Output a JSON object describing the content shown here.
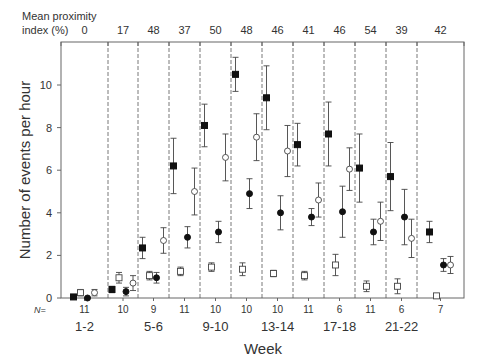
{
  "chart_data": {
    "type": "scatter",
    "title": "",
    "top_label": "Mean proximity index (%)",
    "top_label_lines": [
      "Mean proximity",
      "index (%)"
    ],
    "top_values": [
      "0",
      "17",
      "48",
      "37",
      "50",
      "48",
      "46",
      "41",
      "46",
      "54",
      "39",
      "42"
    ],
    "xlabel": "Week",
    "ylabel": "Number of events per hour",
    "ylim": [
      0,
      11.7
    ],
    "yticks": [
      0,
      2,
      4,
      6,
      8,
      10
    ],
    "n_label": "N=",
    "n_values": [
      "11",
      "10",
      "9",
      "11",
      "10",
      "10",
      "10",
      "11",
      "6",
      "11",
      "6",
      "7"
    ],
    "week_labels": [
      "1-2",
      "5-6",
      "9-10",
      "13-14",
      "17-18",
      "21-22"
    ],
    "groups": [
      "1-2",
      "3-4",
      "5-6",
      "7-8",
      "9-10",
      "11-12",
      "13-14",
      "15-16",
      "17-18",
      "19-20",
      "21-22",
      "23-24"
    ],
    "grid": false,
    "series": [
      {
        "name": "filled-square",
        "marker": "square-filled",
        "values": [
          0.05,
          0.4,
          2.35,
          6.2,
          8.1,
          10.5,
          9.4,
          7.2,
          7.7,
          6.1,
          5.7,
          3.1
        ],
        "err": [
          0.05,
          0.15,
          0.5,
          1.3,
          1.0,
          0.8,
          1.5,
          1.0,
          1.5,
          1.6,
          1.6,
          0.5
        ],
        "x_offset": -11
      },
      {
        "name": "open-square",
        "marker": "square-open",
        "values": [
          0.25,
          0.95,
          1.05,
          1.25,
          1.45,
          1.35,
          1.15,
          1.05,
          1.55,
          0.55,
          0.55,
          0.1
        ],
        "err": [
          0.15,
          0.25,
          0.2,
          0.2,
          0.2,
          0.3,
          0.15,
          0.2,
          0.5,
          0.25,
          0.35,
          0.05
        ],
        "x_offset": -4
      },
      {
        "name": "filled-circle",
        "marker": "circle-filled",
        "values": [
          0.0,
          0.3,
          0.95,
          2.85,
          3.1,
          4.9,
          4.0,
          3.8,
          4.05,
          3.1,
          3.8,
          1.55
        ],
        "err": [
          0.05,
          0.2,
          0.25,
          0.5,
          0.5,
          0.7,
          0.8,
          0.4,
          1.2,
          0.6,
          1.3,
          0.3
        ],
        "x_offset": 3
      },
      {
        "name": "open-circle",
        "marker": "circle-open",
        "values": [
          0.25,
          0.7,
          2.7,
          5.0,
          6.6,
          7.55,
          6.9,
          4.6,
          6.05,
          3.6,
          2.8,
          1.55
        ],
        "err": [
          0.15,
          0.35,
          0.6,
          1.1,
          1.1,
          1.1,
          1.2,
          0.8,
          1.0,
          0.9,
          0.9,
          0.4
        ],
        "x_offset": 10
      }
    ]
  }
}
